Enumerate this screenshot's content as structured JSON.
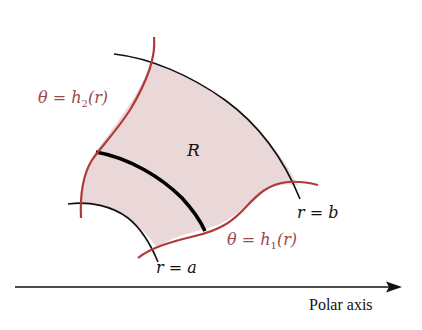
{
  "diagram": {
    "region_label": "R",
    "curves": {
      "h2": {
        "label_prefix": "θ = h",
        "subscript": "2",
        "label_suffix": "(r)"
      },
      "h1": {
        "label_prefix": "θ = h",
        "subscript": "1",
        "label_suffix": "(r)"
      }
    },
    "arcs": {
      "inner": "r = a",
      "outer": "r = b"
    },
    "axis_label": "Polar axis",
    "colors": {
      "boundary_red": "#b03a3a",
      "label_red": "#9a4a4a",
      "region_fill": "#ead7d7",
      "arc_black": "#111111"
    }
  }
}
